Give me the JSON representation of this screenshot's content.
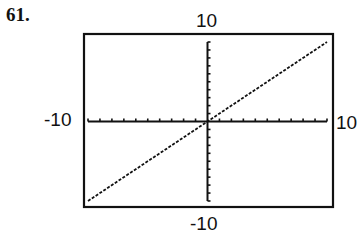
{
  "problem_number": "61.",
  "window": {
    "ymax_label": "10",
    "xmin_label": "-10",
    "xmax_label": "10",
    "ymin_label": "-10"
  },
  "chart_data": {
    "type": "line",
    "title": "",
    "xlabel": "",
    "ylabel": "",
    "xlim": [
      -10,
      10
    ],
    "ylim": [
      -10,
      10
    ],
    "xscale": 1,
    "yscale": 1,
    "grid": false,
    "legend": null,
    "tick_labels": {
      "top": "10",
      "left": "-10",
      "right": "10",
      "bottom": "-10"
    },
    "series": [
      {
        "name": "y = x",
        "style": "dotted",
        "x": [
          -10,
          10
        ],
        "y": [
          -10,
          10
        ]
      }
    ]
  },
  "colors": {
    "ink": "#111111",
    "background": "#ffffff"
  }
}
